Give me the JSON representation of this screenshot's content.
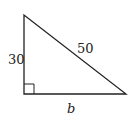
{
  "diagram": {
    "type": "right-triangle",
    "stroke_color": "#222222",
    "vertices": {
      "top": [
        24,
        15
      ],
      "right_angle": [
        24,
        94
      ],
      "right": [
        126,
        94
      ]
    },
    "labels": {
      "vertical_leg": "30",
      "hypotenuse": "50",
      "horizontal_leg": "b"
    },
    "right_angle_marker": true
  }
}
